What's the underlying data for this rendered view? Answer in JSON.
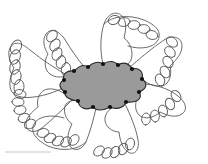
{
  "figure": {
    "subject_label": "radiate-cell-schematic",
    "background_color": "#ffffff",
    "scale_bar": {
      "visible": true,
      "label": "",
      "color": "#c9c9c9",
      "x": 5,
      "y": 152,
      "length": 46,
      "thickness": 1
    },
    "central_body": {
      "name": "central-cell-body",
      "fill_color": "#9a9a9a",
      "stroke_color": "#2b2b2b",
      "stroke_width": 1.1,
      "center_x": 104,
      "center_y": 86,
      "radius_x": 42,
      "radius_y": 23,
      "scallop_count": 10,
      "outline_points": [
        [
          72,
          72
        ],
        [
          86,
          68
        ],
        [
          101,
          65
        ],
        [
          116,
          66
        ],
        [
          131,
          70
        ],
        [
          143,
          78
        ],
        [
          145,
          90
        ],
        [
          136,
          100
        ],
        [
          121,
          106
        ],
        [
          105,
          108
        ],
        [
          89,
          107
        ],
        [
          76,
          103
        ],
        [
          65,
          95
        ],
        [
          63,
          82
        ]
      ]
    },
    "attachment_nodes": {
      "name": "arm-attachment-node",
      "color": "#111111",
      "radius": 2.1,
      "count": 11,
      "points": [
        [
          74,
          71
        ],
        [
          88,
          67
        ],
        [
          103,
          64
        ],
        [
          118,
          65
        ],
        [
          132,
          69
        ],
        [
          142,
          79
        ],
        [
          139,
          92
        ],
        [
          126,
          102
        ],
        [
          110,
          107
        ],
        [
          93,
          107
        ],
        [
          78,
          101
        ],
        [
          65,
          92
        ],
        [
          64,
          80
        ]
      ]
    },
    "arms": [
      {
        "id": "arm-upper-left-far",
        "angle_deg": 198,
        "base_x": 70,
        "base_y": 76,
        "tip_x": 24,
        "tip_y": 46,
        "loop_count": 5,
        "stroke_color": "#555555"
      },
      {
        "id": "arm-upper-left",
        "angle_deg": 235,
        "base_x": 84,
        "base_y": 68,
        "tip_x": 62,
        "tip_y": 28,
        "loop_count": 5,
        "stroke_color": "#555555"
      },
      {
        "id": "arm-top",
        "angle_deg": 268,
        "base_x": 104,
        "base_y": 64,
        "tip_x": 110,
        "tip_y": 16,
        "loop_count": 5,
        "stroke_color": "#555555"
      },
      {
        "id": "arm-upper-right",
        "angle_deg": 310,
        "base_x": 128,
        "base_y": 68,
        "tip_x": 166,
        "tip_y": 34,
        "loop_count": 5,
        "stroke_color": "#555555"
      },
      {
        "id": "arm-right",
        "angle_deg": 18,
        "base_x": 142,
        "base_y": 86,
        "tip_x": 178,
        "tip_y": 104,
        "loop_count": 5,
        "stroke_color": "#555555"
      },
      {
        "id": "arm-lower-right",
        "angle_deg": 62,
        "base_x": 124,
        "base_y": 104,
        "tip_x": 136,
        "tip_y": 148,
        "loop_count": 5,
        "stroke_color": "#555555"
      },
      {
        "id": "arm-bottom",
        "angle_deg": 100,
        "base_x": 96,
        "base_y": 108,
        "tip_x": 84,
        "tip_y": 150,
        "loop_count": 5,
        "stroke_color": "#555555"
      },
      {
        "id": "arm-lower-left",
        "angle_deg": 146,
        "base_x": 72,
        "base_y": 100,
        "tip_x": 36,
        "tip_y": 134,
        "loop_count": 5,
        "stroke_color": "#555555"
      }
    ],
    "line_style": {
      "arm_stroke_color": "#5a5a5a",
      "arm_stroke_width": 0.9,
      "loop_stroke_color": "#5a5a5a",
      "loop_stroke_width": 0.9,
      "loop_fill": "none"
    }
  }
}
